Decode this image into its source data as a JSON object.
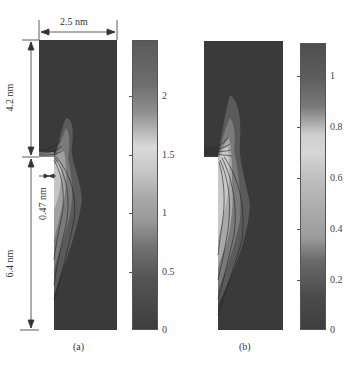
{
  "figure": {
    "panels": [
      {
        "id": "a",
        "caption": "(a)",
        "colorbar": {
          "min": 0,
          "max": 2.4,
          "ticks": [
            "2",
            "1.5",
            "1",
            "0.5",
            "0"
          ]
        }
      },
      {
        "id": "b",
        "caption": "(b)",
        "colorbar": {
          "min": 0,
          "max": 1.15,
          "ticks": [
            "1",
            "0.8",
            "0.6",
            "0.4",
            "0.2",
            "0"
          ]
        }
      }
    ],
    "dimensions": {
      "width": "2.5 nm",
      "upper_height": "4.2 nm",
      "lower_height": "6.4 nm",
      "notch_width": "0.47 nm"
    }
  },
  "colors": {
    "background": "#ffffff",
    "field_low": "#3a3a3a",
    "field_high": "#d8d8d8",
    "line": "#444444"
  }
}
